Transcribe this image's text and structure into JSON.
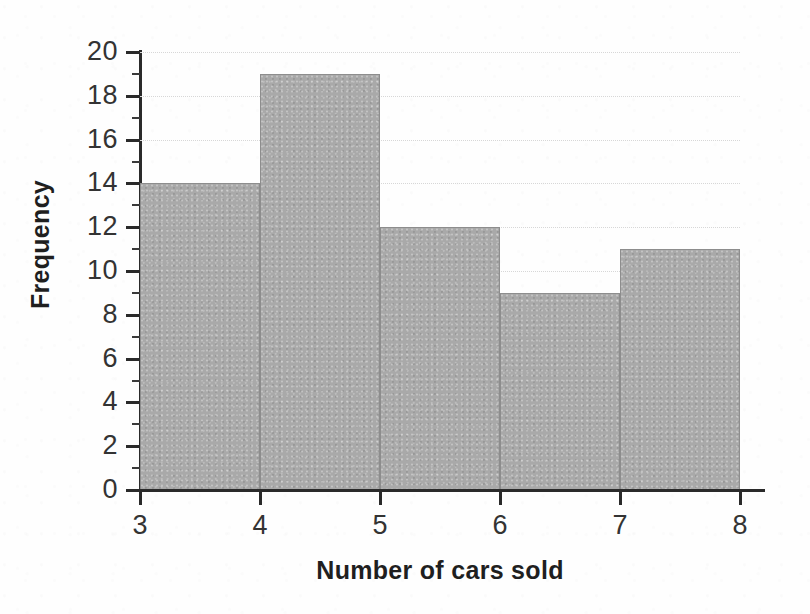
{
  "chart_data": {
    "type": "bar",
    "subtype": "histogram",
    "title": "",
    "xlabel": "Number of cars sold",
    "ylabel": "Frequency",
    "categories": [
      "3-4",
      "4-5",
      "5-6",
      "6-7",
      "7-8"
    ],
    "bin_edges": [
      3,
      4,
      5,
      6,
      7,
      8
    ],
    "values": [
      14,
      19,
      12,
      9,
      11
    ],
    "bars": [
      {
        "bin_start": 3,
        "bin_end": 4,
        "value": 14
      },
      {
        "bin_start": 4,
        "bin_end": 5,
        "value": 19
      },
      {
        "bin_start": 5,
        "bin_end": 6,
        "value": 12
      },
      {
        "bin_start": 6,
        "bin_end": 7,
        "value": 9
      },
      {
        "bin_start": 7,
        "bin_end": 8,
        "value": 11
      }
    ],
    "xlim": [
      3,
      8
    ],
    "ylim": [
      0,
      20
    ],
    "x_ticks": [
      3,
      4,
      5,
      6,
      7,
      8
    ],
    "x_tick_labels": [
      "3",
      "4",
      "5",
      "6",
      "7",
      "8"
    ],
    "y_ticks": [
      0,
      2,
      4,
      6,
      8,
      10,
      12,
      14,
      16,
      18,
      20
    ],
    "y_tick_labels": [
      "0",
      "2",
      "4",
      "6",
      "8",
      "10",
      "12",
      "14",
      "16",
      "18",
      "20"
    ],
    "y_minor_ticks": [
      1,
      3,
      5,
      7,
      9,
      11,
      13,
      15,
      17,
      19
    ],
    "grid": true,
    "grid_axis": "y",
    "legend": false,
    "legend_position": "none",
    "bar_color": "#a9a9a9",
    "bar_edge_color": "#8d8d8d",
    "axis_color": "#2a2a2a",
    "grid_color": "#d7d7d7",
    "text_color": "#333333",
    "title_color": "#1f1f1f",
    "background_color": "#ffffff"
  }
}
